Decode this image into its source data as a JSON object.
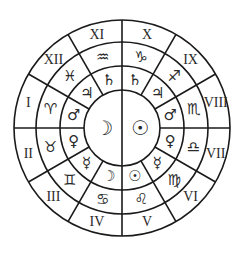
{
  "geometry": {
    "cx": 122,
    "cy": 128,
    "r_center": 38,
    "r_planets": 62,
    "r_signs": 86,
    "r_outer": 108
  },
  "center": {
    "left": {
      "name": "moon",
      "glyph": "☽"
    },
    "right": {
      "name": "sun",
      "glyph": "☉"
    }
  },
  "houses": [
    {
      "numeral": "I",
      "angle": 165,
      "sign": "♈︎",
      "sign_name": "aries",
      "planet": "♂",
      "planet_name": "mars"
    },
    {
      "numeral": "II",
      "angle": 195,
      "sign": "♉︎",
      "sign_name": "taurus",
      "planet": "♀",
      "planet_name": "venus"
    },
    {
      "numeral": "III",
      "angle": 225,
      "sign": "♊︎",
      "sign_name": "gemini",
      "planet": "☿",
      "planet_name": "mercury"
    },
    {
      "numeral": "IV",
      "angle": 255,
      "sign": "♋︎",
      "sign_name": "cancer",
      "planet": "☽",
      "planet_name": "moon"
    },
    {
      "numeral": "V",
      "angle": 285,
      "sign": "♌︎",
      "sign_name": "leo",
      "planet": "☉",
      "planet_name": "sun"
    },
    {
      "numeral": "VI",
      "angle": 315,
      "sign": "♍︎",
      "sign_name": "virgo",
      "planet": "☿",
      "planet_name": "mercury"
    },
    {
      "numeral": "VII",
      "angle": 345,
      "sign": "♎︎",
      "sign_name": "libra",
      "planet": "♀",
      "planet_name": "venus"
    },
    {
      "numeral": "VIII",
      "angle": 15,
      "sign": "♏︎",
      "sign_name": "scorpio",
      "planet": "♂",
      "planet_name": "mars"
    },
    {
      "numeral": "IX",
      "angle": 45,
      "sign": "♐︎",
      "sign_name": "sagittarius",
      "planet": "♃",
      "planet_name": "jupiter"
    },
    {
      "numeral": "X",
      "angle": 75,
      "sign": "♑︎",
      "sign_name": "capricorn",
      "planet": "♄",
      "planet_name": "saturn"
    },
    {
      "numeral": "XI",
      "angle": 105,
      "sign": "♒︎",
      "sign_name": "aquarius",
      "planet": "♄",
      "planet_name": "saturn"
    },
    {
      "numeral": "XII",
      "angle": 135,
      "sign": "♓︎",
      "sign_name": "pisces",
      "planet": "♃",
      "planet_name": "jupiter"
    }
  ]
}
